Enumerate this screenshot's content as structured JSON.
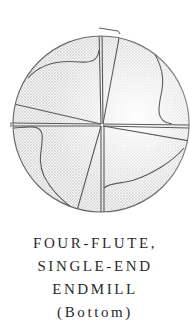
{
  "figure": {
    "colors": {
      "stroke": "#555555",
      "fill_light": "#f2f2f2",
      "fill_dot": "#b8b8b8",
      "background": "#ffffff"
    }
  },
  "caption": {
    "lines": [
      "FOUR-FLUTE,",
      "SINGLE-END",
      "ENDMILL",
      "(Bottom)"
    ]
  }
}
